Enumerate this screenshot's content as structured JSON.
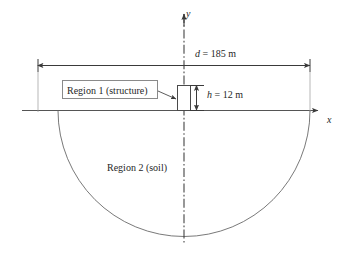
{
  "figure": {
    "kind": "engineering-cross-section-diagram",
    "background_color": "#ffffff",
    "line_color": "#4a4a4a",
    "text_color": "#1f1f1f"
  },
  "axes": {
    "y_label": "y",
    "x_label": "x",
    "y_axis_style": "dash-dot centerline",
    "x_axis_style": "solid ground line with arrowhead"
  },
  "dimensions": {
    "width": {
      "symbol": "d",
      "equals": "=",
      "value": "185",
      "unit": "m",
      "full": "d = 185 m"
    },
    "height": {
      "symbol": "h",
      "equals": "=",
      "value": "12",
      "unit": "m",
      "full": "h = 12 m"
    }
  },
  "regions": {
    "region1": {
      "label": "Region 1 (structure)",
      "shape": "rectangle straddling the y-axis above ground"
    },
    "region2": {
      "label": "Region 2 (soil)",
      "shape": "semicircle below ground line"
    }
  },
  "icons": {
    "y_arrow": "arrow-up-icon",
    "x_arrow": "arrow-right-icon",
    "leader": "leader-arrow-icon",
    "dim_arrow_left": "dimension-arrow-left-icon",
    "dim_arrow_right": "dimension-arrow-right-icon",
    "dim_arrow_up": "dimension-arrow-up-icon",
    "dim_arrow_down": "dimension-arrow-down-icon"
  }
}
